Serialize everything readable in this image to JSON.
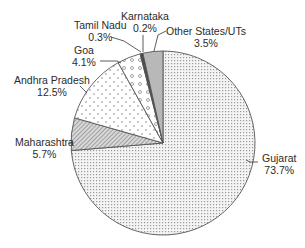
{
  "chart_data": {
    "type": "pie",
    "title": "",
    "start_angle_deg": 0,
    "direction": "clockwise",
    "slices": [
      {
        "label": "Gujarat",
        "value": 73.7,
        "display": "73.7%",
        "pattern": "fine-dots"
      },
      {
        "label": "Maharashtra",
        "value": 5.7,
        "display": "5.7%",
        "pattern": "diagonal-hatch"
      },
      {
        "label": "Andhra Pradesh",
        "value": 12.5,
        "display": "12.5%",
        "pattern": "sparse-dots"
      },
      {
        "label": "Goa",
        "value": 4.1,
        "display": "4.1%",
        "pattern": "circles"
      },
      {
        "label": "Tamil Nadu",
        "value": 0.3,
        "display": "0.3%",
        "pattern": "solid-dark"
      },
      {
        "label": "Karnataka",
        "value": 0.2,
        "display": "0.2%",
        "pattern": "solid-black"
      },
      {
        "label": "Other States/UTs",
        "value": 3.5,
        "display": "3.5%",
        "pattern": "solid-gray"
      }
    ],
    "legend": "none (direct labels with leader lines)"
  },
  "labels": {
    "gujarat": {
      "name": "Gujarat",
      "pct": "73.7%"
    },
    "maharashtra": {
      "name": "Maharashtra",
      "pct": "5.7%"
    },
    "andhra": {
      "name": "Andhra Pradesh",
      "pct": "12.5%"
    },
    "goa": {
      "name": "Goa",
      "pct": "4.1%"
    },
    "tamil": {
      "name": "Tamil Nadu",
      "pct": "0.3%"
    },
    "karnataka": {
      "name": "Karnataka",
      "pct": "0.2%"
    },
    "other": {
      "name": "Other States/UTs",
      "pct": "3.5%"
    }
  }
}
